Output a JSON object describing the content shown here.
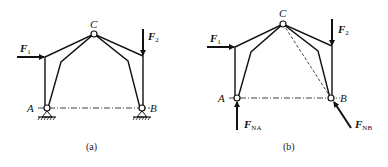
{
  "figures": [
    {
      "id": "a",
      "caption": "(a)",
      "labels": {
        "C": "C",
        "A": "A",
        "B": "B"
      },
      "forces": [
        {
          "name": "F",
          "sub": "1"
        },
        {
          "name": "F",
          "sub": "2"
        }
      ],
      "supports": [
        "pin-support-A",
        "pin-support-B"
      ]
    },
    {
      "id": "b",
      "caption": "(b)",
      "labels": {
        "C": "C",
        "A": "A",
        "B": "B"
      },
      "forces": [
        {
          "name": "F",
          "sub": "1"
        },
        {
          "name": "F",
          "sub": "2"
        },
        {
          "name": "F",
          "sub": "NA"
        },
        {
          "name": "F",
          "sub": "NB"
        }
      ]
    }
  ],
  "colors": {
    "line": "#111111",
    "background": "#ffffff"
  }
}
